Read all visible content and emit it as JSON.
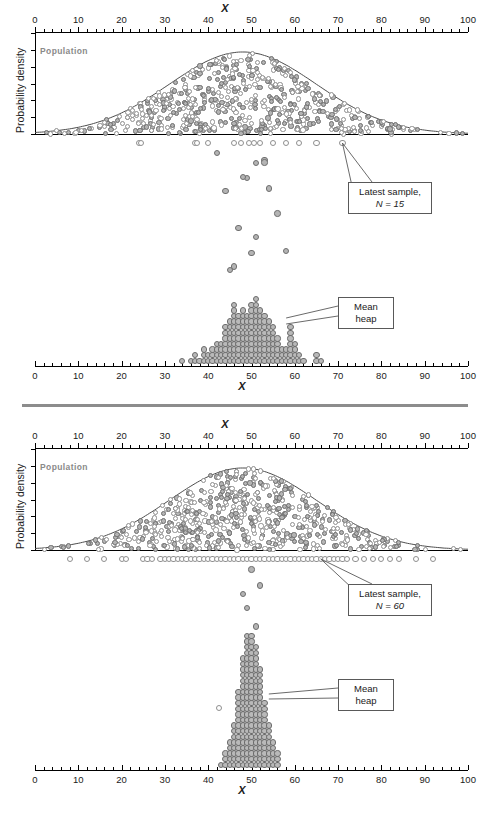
{
  "figure": {
    "type": "sampling-distribution-simulation",
    "panels": [
      {
        "id": "top",
        "sample_size_label": "Latest sample,",
        "sample_size_value": "N = 15",
        "mean_heap_label_line1": "Mean",
        "mean_heap_label_line2": "heap",
        "population_label": "Population",
        "ylabel": "Probability density",
        "xlabel": "X"
      },
      {
        "id": "bottom",
        "sample_size_label": "Latest sample,",
        "sample_size_value": "N = 60",
        "mean_heap_label_line1": "Mean",
        "mean_heap_label_line2": "heap",
        "population_label": "Population",
        "ylabel": "Probability density",
        "xlabel": "X"
      }
    ]
  },
  "chart_data": {
    "type": "scatter",
    "title": "",
    "xlabel": "X",
    "ylabel": "Probability density",
    "xlim": [
      0,
      100
    ],
    "xticks": [
      0,
      10,
      20,
      30,
      40,
      50,
      60,
      70,
      80,
      90,
      100
    ],
    "xtick_labels": [
      "0",
      "10",
      "20",
      "30",
      "40",
      "50",
      "60",
      "70",
      "80",
      "90",
      "100"
    ],
    "minor_tick_step": 2,
    "grid": false,
    "legend": "none",
    "population": {
      "distribution": "normal",
      "mean": 48,
      "sd": 17,
      "label": "Population"
    },
    "panels": [
      {
        "name": "N = 15",
        "sample_n": 15,
        "latest_sample_values": [
          24,
          24.5,
          37,
          37.5,
          40,
          46,
          47.5,
          49.5,
          50.5,
          52,
          55,
          58,
          61,
          65,
          71
        ],
        "falling_means": [
          51,
          53,
          47,
          54,
          44,
          49,
          56,
          46,
          58,
          42,
          51,
          48,
          53,
          45,
          50
        ],
        "mean_heap": {
          "bin_centers": [
            34,
            36,
            37,
            38,
            39,
            40,
            41,
            42,
            43,
            44,
            45,
            46,
            47,
            48,
            49,
            50,
            51,
            52,
            53,
            54,
            55,
            56,
            57,
            58,
            59,
            60,
            61,
            62,
            65,
            66
          ],
          "counts": [
            1,
            1,
            2,
            1,
            3,
            2,
            3,
            4,
            4,
            7,
            8,
            11,
            9,
            10,
            9,
            11,
            12,
            10,
            9,
            8,
            7,
            5,
            3,
            3,
            7,
            4,
            2,
            1,
            2,
            1
          ],
          "center": 50,
          "spread_description": "wide"
        }
      },
      {
        "name": "N = 60",
        "sample_n": 60,
        "latest_sample_values": [
          8,
          12,
          16,
          20,
          21,
          25,
          26,
          27,
          29,
          30,
          31,
          32,
          33,
          34,
          35,
          36,
          37,
          38,
          39,
          40,
          41,
          42,
          43,
          44,
          45,
          46,
          47,
          48,
          49,
          50,
          51,
          52,
          53,
          54,
          55,
          56,
          57,
          58,
          59,
          60,
          61,
          62,
          63,
          64,
          65,
          66,
          67,
          68,
          69,
          70,
          71,
          72,
          74,
          76,
          78,
          80,
          82,
          84,
          88,
          92
        ],
        "falling_means": [
          49,
          50,
          51,
          48,
          52
        ],
        "mean_heap": {
          "bin_centers": [
            43,
            44,
            45,
            46,
            47,
            48,
            49,
            50,
            51,
            52,
            53,
            54,
            55,
            56
          ],
          "counts": [
            1,
            3,
            5,
            8,
            14,
            20,
            24,
            24,
            22,
            18,
            12,
            8,
            5,
            3
          ],
          "center": 50,
          "spread_description": "narrow"
        }
      }
    ]
  },
  "colors": {
    "axis": "#000000",
    "curve": "#4d4d4d",
    "open_dot_stroke": "#8f8f8f",
    "gray_dot_fill": "#b4b4b4",
    "heap_dot_fill": "#b9b9b9",
    "divider": "#8c8c8c",
    "population_label": "#8a8a8a"
  }
}
